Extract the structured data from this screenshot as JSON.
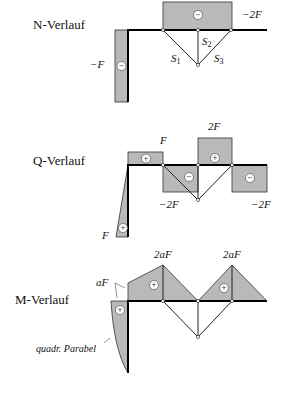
{
  "panels": {
    "normal_force": {
      "title": "N-Verlauf",
      "labels": {
        "column_value": "−F",
        "beam_value": "−2F",
        "s1": "S",
        "s1_sub": "1",
        "s2": "S",
        "s2_sub": "2",
        "s3": "S",
        "s3_sub": "3"
      },
      "signs": {
        "column": "−",
        "beam": "−"
      }
    },
    "shear_force": {
      "title": "Q-Verlauf",
      "labels": {
        "left_top": "F",
        "mid_top": "2F",
        "mid_neg": "−2F",
        "right_neg": "−2F",
        "column_bottom": "F"
      },
      "signs": {
        "left": "+",
        "mid_neg": "−",
        "mid_pos": "+",
        "right": "−",
        "column": "+"
      }
    },
    "bending_moment": {
      "title": "M-Verlauf",
      "labels": {
        "peak_left": "2aF",
        "peak_right": "2aF",
        "corner": "aF",
        "parabola": "quadr. Parabel"
      },
      "signs": {
        "left": "+",
        "right": "+",
        "column": "+"
      }
    }
  },
  "colors": {
    "area_fill": "#b9b9b9",
    "line": "#000000"
  }
}
